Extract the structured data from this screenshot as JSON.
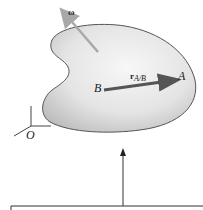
{
  "diagram": {
    "labels": {
      "omega": "ω",
      "point_a": "A",
      "point_b": "B",
      "origin": "O",
      "r_vector": "r",
      "r_subscript": "A/B"
    },
    "colors": {
      "body_fill_light": "#f4f4f4",
      "body_fill_dark": "#c8c8c8",
      "body_outline": "#555555",
      "omega_arrow": "#a8a8a8",
      "r_arrow": "#555555",
      "axes": "#444444",
      "ground_arrow": "#333333"
    }
  }
}
